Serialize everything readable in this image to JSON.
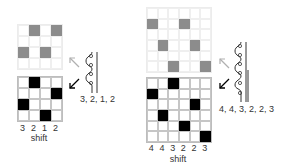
{
  "left": {
    "rows": 4,
    "cols": 4,
    "top_grid_cells": [
      [
        0,
        1
      ],
      [
        0,
        3
      ],
      [
        2,
        0
      ],
      [
        2,
        2
      ]
    ],
    "bottom_grid_cells": [
      [
        0,
        1
      ],
      [
        1,
        3
      ],
      [
        2,
        0
      ],
      [
        3,
        2
      ]
    ],
    "shifts": [
      "3",
      "2",
      "1",
      "2"
    ],
    "shift_label": "shift",
    "sequence": "3, 2, 1, 2",
    "coil_circles": 4
  },
  "right": {
    "rows": 6,
    "cols": 6,
    "top_grid_cells": [
      [
        1,
        0
      ],
      [
        1,
        3
      ],
      [
        3,
        1
      ],
      [
        3,
        4
      ],
      [
        5,
        2
      ],
      [
        5,
        5
      ]
    ],
    "bottom_grid_cells": [
      [
        0,
        2
      ],
      [
        1,
        0
      ],
      [
        2,
        4
      ],
      [
        3,
        1
      ],
      [
        4,
        3
      ],
      [
        5,
        5
      ]
    ],
    "shifts": [
      "4",
      "4",
      "3",
      "2",
      "2",
      "3"
    ],
    "shift_label": "shift",
    "sequence": "4, 4, 3, 2, 2, 3",
    "coil_circles": 6
  },
  "colors": {
    "faint_cell": "#8c8c8c",
    "dark_cell": "#000000",
    "arrow_up": "#b0b0b0",
    "arrow_down": "#000000"
  }
}
